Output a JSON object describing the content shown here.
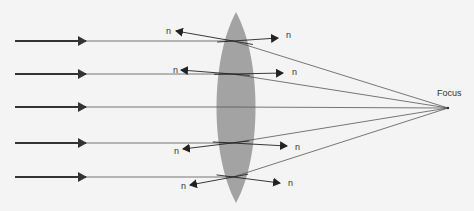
{
  "colors": {
    "background": "#f4f4f4",
    "lens": "#a3a3a3",
    "ray": "#555555",
    "incoming_ray": "#333333",
    "normal": "#222222",
    "text": "#333333"
  },
  "lens": {
    "center_x": 236,
    "top_y": 12,
    "bottom_y": 203,
    "half_width": 19
  },
  "focus": {
    "label": "Focus",
    "x": 448,
    "y": 108,
    "label_x": 437,
    "label_y": 96
  },
  "rays": [
    {
      "y": 41,
      "lens_x": 233,
      "normal": {
        "a": [
          176,
          31
        ],
        "b": [
          278,
          38
        ]
      }
    },
    {
      "y": 74,
      "lens_x": 232,
      "normal": {
        "a": [
          181,
          70
        ],
        "b": [
          283,
          73
        ]
      }
    },
    {
      "y": 107,
      "lens_x": 232,
      "normal": null
    },
    {
      "y": 143,
      "lens_x": 232,
      "normal": {
        "a": [
          183,
          149
        ],
        "b": [
          287,
          146
        ]
      }
    },
    {
      "y": 177,
      "lens_x": 233,
      "normal": {
        "a": [
          190,
          185
        ],
        "b": [
          280,
          183
        ]
      }
    }
  ],
  "normal_label": "n",
  "normal_labels": [
    {
      "text": "n",
      "x": 166,
      "y": 34
    },
    {
      "text": "n",
      "x": 286,
      "y": 38
    },
    {
      "text": "n",
      "x": 173,
      "y": 73
    },
    {
      "text": "n",
      "x": 292,
      "y": 75
    },
    {
      "text": "n",
      "x": 174,
      "y": 154
    },
    {
      "text": "n",
      "x": 295,
      "y": 150
    },
    {
      "text": "n",
      "x": 181,
      "y": 189
    },
    {
      "text": "n",
      "x": 288,
      "y": 186
    }
  ],
  "refraction_lines": [
    {
      "from": [
        215,
        48
      ],
      "to": [
        270,
        32
      ]
    },
    {
      "from": [
        228,
        80
      ],
      "to": [
        286,
        71
      ]
    },
    {
      "from": [
        231,
        140
      ],
      "to": [
        287,
        148
      ]
    },
    {
      "from": [
        231,
        170
      ],
      "to": [
        281,
        184
      ]
    }
  ]
}
